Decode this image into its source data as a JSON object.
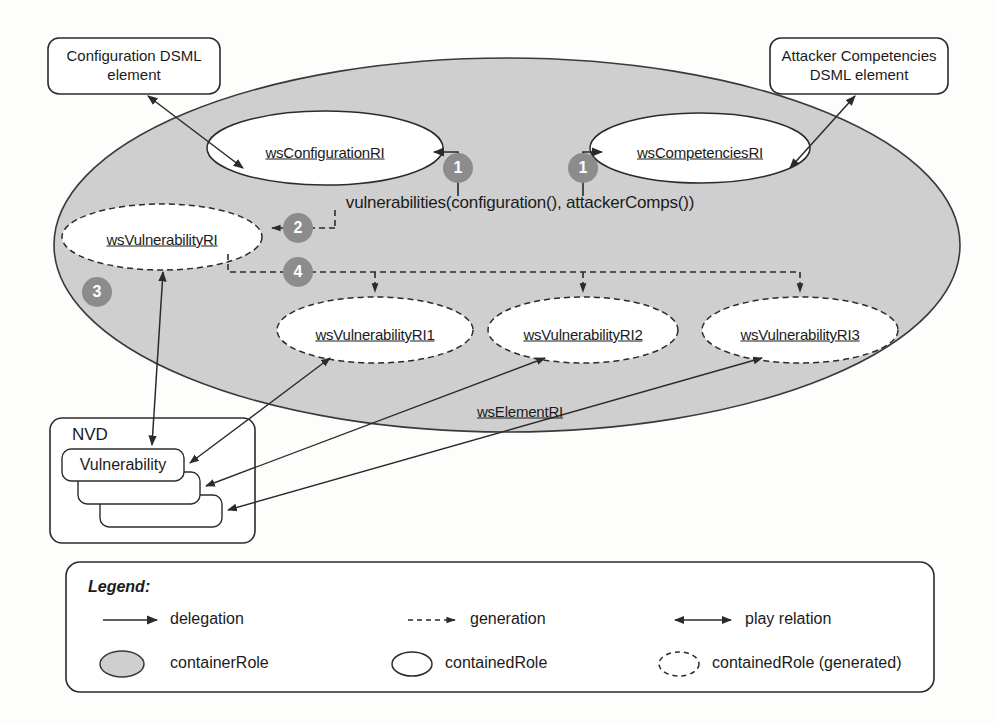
{
  "figure": {
    "colors": {
      "container_fill": "#cfcfcf",
      "container_stroke": "#3a3a3a",
      "contained_fill": "#ffffff",
      "contained_stroke": "#2b2b2b",
      "marker_fill": "#8c8c8c",
      "marker_text": "#ffffff",
      "line": "#2b2b2b",
      "text": "#1b1b1b",
      "box_stroke": "#2b2b2b"
    }
  },
  "notes": [
    {
      "id": "config-note",
      "line1": "Configuration DSML",
      "line2": "element"
    },
    {
      "id": "attacker-note",
      "line1": "Attacker Competencies",
      "line2": "DSML element"
    }
  ],
  "roles": {
    "container": "wsElementRI",
    "configuration": "wsConfigurationRI",
    "competencies": "wsCompetenciesRI",
    "vulnerability": "wsVulnerabilityRI",
    "generated": [
      "wsVulnerabilityRI1",
      "wsVulnerabilityRI2",
      "wsVulnerabilityRI3"
    ]
  },
  "expression": "vulnerabilities(configuration(),  attackerComps())",
  "markers": [
    "1",
    "1",
    "2",
    "3",
    "4"
  ],
  "nvd": {
    "title": "NVD",
    "items": [
      "Vulnerability",
      "",
      ""
    ]
  },
  "legend": {
    "title": "Legend:",
    "relations": [
      {
        "name": "delegation",
        "style": "solid-arrow"
      },
      {
        "name": "generation",
        "style": "dashed-arrow"
      },
      {
        "name": "play relation",
        "style": "double-arrow"
      }
    ],
    "shapes": [
      {
        "name": "containerRole",
        "style": "filled-ellipse"
      },
      {
        "name": "containedRole",
        "style": "solid-ellipse"
      },
      {
        "name": "containedRole (generated)",
        "style": "dashed-ellipse"
      }
    ]
  }
}
